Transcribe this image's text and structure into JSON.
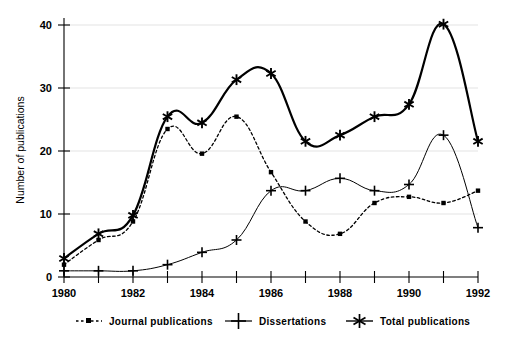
{
  "chart_data": {
    "type": "line",
    "title": "",
    "xlabel": "",
    "ylabel": "Number of publications",
    "xlim": [
      1980,
      1992
    ],
    "ylim": [
      0,
      42
    ],
    "yticks": [
      0,
      10,
      20,
      30,
      40
    ],
    "ytick_labels": [
      "0",
      "10",
      "20",
      "30",
      "40"
    ],
    "xticks": [
      1980,
      1981,
      1982,
      1983,
      1984,
      1985,
      1986,
      1987,
      1988,
      1989,
      1990,
      1991,
      1992
    ],
    "xtick_labels": [
      "1980",
      "",
      "1982",
      "",
      "1984",
      "",
      "1986",
      "",
      "1988",
      "",
      "1990",
      "",
      "1992"
    ],
    "grid": true,
    "legend_position": "below",
    "x": [
      1980,
      1981,
      1982,
      1983,
      1984,
      1985,
      1986,
      1987,
      1988,
      1989,
      1990,
      1991,
      1992
    ],
    "series": [
      {
        "name": "Journal publications",
        "marker": "square",
        "linestyle": "dotted",
        "values": [
          2,
          6,
          9,
          24,
          20,
          26,
          17,
          9,
          7,
          12,
          13,
          12,
          14
        ]
      },
      {
        "name": "Dissertations",
        "marker": "plus",
        "linestyle": "solid",
        "values": [
          1,
          1,
          1,
          2,
          4,
          6,
          14,
          14,
          16,
          14,
          15,
          23,
          8
        ]
      },
      {
        "name": "Total publications",
        "marker": "star",
        "linestyle": "solid-thick",
        "values": [
          3,
          7,
          10,
          26,
          25,
          32,
          33,
          22,
          23,
          26,
          28,
          41,
          22
        ]
      }
    ]
  },
  "legend": {
    "items": [
      {
        "label": "Journal publications",
        "marker": "square-dotted"
      },
      {
        "label": "Dissertations",
        "marker": "plus"
      },
      {
        "label": "Total publications",
        "marker": "star"
      }
    ]
  },
  "axes": {
    "y_axis_title": "Number of publications",
    "y_tick_0": "0",
    "y_tick_1": "10",
    "y_tick_2": "20",
    "y_tick_3": "30",
    "y_tick_4": "40",
    "x_tick_1980": "1980",
    "x_tick_1982": "1982",
    "x_tick_1984": "1984",
    "x_tick_1986": "1986",
    "x_tick_1988": "1988",
    "x_tick_1990": "1990",
    "x_tick_1992": "1992"
  },
  "colors": {
    "ink": "#000000",
    "grid": "#d8d8d8",
    "background": "#ffffff"
  }
}
